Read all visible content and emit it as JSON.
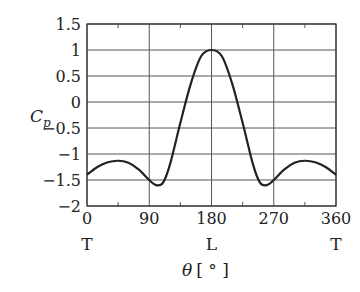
{
  "chart_data": {
    "type": "line",
    "title": "",
    "xlabel": "θ [°]",
    "ylabel": "C_p",
    "xlim": [
      0,
      360
    ],
    "ylim": [
      -2,
      1.5
    ],
    "grid": true,
    "xticks": [
      0,
      90,
      180,
      270,
      360
    ],
    "xtick_labels": [
      "0",
      "90",
      "180",
      "270",
      "360"
    ],
    "xtick_sublabels": [
      "T",
      "",
      "L",
      "",
      "T"
    ],
    "yticks": [
      1.5,
      1,
      0.5,
      0,
      -0.5,
      -1,
      -1.5,
      -2
    ],
    "ytick_labels": [
      "1.5",
      "1",
      "0.5",
      "0",
      "−0.5",
      "−1",
      "−1.5",
      "−2"
    ],
    "series": [
      {
        "name": "Cp",
        "x": [
          0,
          15,
          30,
          45,
          60,
          75,
          90,
          100,
          110,
          120,
          135,
          150,
          165,
          180,
          195,
          210,
          225,
          240,
          250,
          260,
          270,
          285,
          300,
          315,
          330,
          345,
          360
        ],
        "y": [
          -1.4,
          -1.25,
          -1.16,
          -1.13,
          -1.17,
          -1.3,
          -1.5,
          -1.6,
          -1.55,
          -1.2,
          -0.4,
          0.35,
          0.88,
          1.0,
          0.88,
          0.35,
          -0.4,
          -1.2,
          -1.55,
          -1.6,
          -1.5,
          -1.3,
          -1.17,
          -1.13,
          -1.16,
          -1.25,
          -1.4
        ]
      }
    ]
  },
  "axis": {
    "ylabel_main": "C",
    "ylabel_sub": "p",
    "xlabel_main": "θ",
    "xlabel_unit": "[ ° ]"
  }
}
